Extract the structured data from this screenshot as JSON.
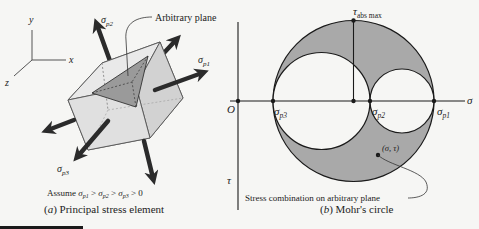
{
  "panel_a": {
    "caption": "(a) Principal stress element",
    "caption_letter": "a",
    "caption_text": "Principal stress element",
    "axes": {
      "x": "x",
      "y": "y",
      "z": "z"
    },
    "arbitrary_plane_label": "Arbitrary plane",
    "stress_labels": {
      "p1": "σp1",
      "p2": "σp2",
      "p3": "σp3"
    },
    "assumption": "Assume σp1 > σp2 > σp3 > 0"
  },
  "panel_b": {
    "caption": "(b) Mohr's circle",
    "caption_letter": "b",
    "caption_text": "Mohr's circle",
    "origin_label": "O",
    "sigma_axis_label": "σ",
    "tau_axis_label": "τ",
    "tau_abs_max_label": "τabs max",
    "points": {
      "p3": "σp3",
      "p2": "σp2",
      "p1": "σp1"
    },
    "point_label": "(σ, τ)",
    "annotation": "Stress combination on arbitrary plane"
  },
  "colors": {
    "shade": "#a9a9a9",
    "line": "#1a1a1a",
    "cube_light": "#e4e4e4",
    "cube_mid": "#cfcfcf",
    "plane": "#9a9a9a",
    "arrow": "#2b2b2b"
  }
}
